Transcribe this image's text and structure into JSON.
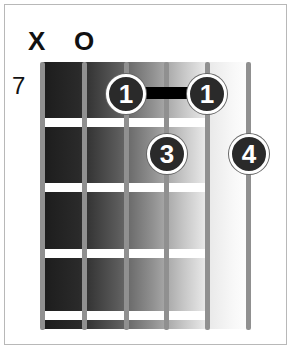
{
  "diagram": {
    "type": "guitar-chord",
    "starting_fret": "7",
    "open_muted": [
      {
        "string": 1,
        "mark": "X"
      },
      {
        "string": 2,
        "mark": "O"
      }
    ],
    "strings": 6,
    "frets_shown": 4,
    "fingers": [
      {
        "string": 3,
        "fret": 1,
        "label": "1"
      },
      {
        "string": 5,
        "fret": 1,
        "label": "1"
      },
      {
        "string": 4,
        "fret": 2,
        "label": "3"
      },
      {
        "string": 6,
        "fret": 2,
        "label": "4"
      }
    ],
    "barre": {
      "from_string": 3,
      "to_string": 5,
      "fret": 1
    },
    "colors": {
      "board_dark": "#1c1c1c",
      "string": "#909090",
      "dot": "#2a2a2a",
      "fret": "#ffffff"
    }
  }
}
